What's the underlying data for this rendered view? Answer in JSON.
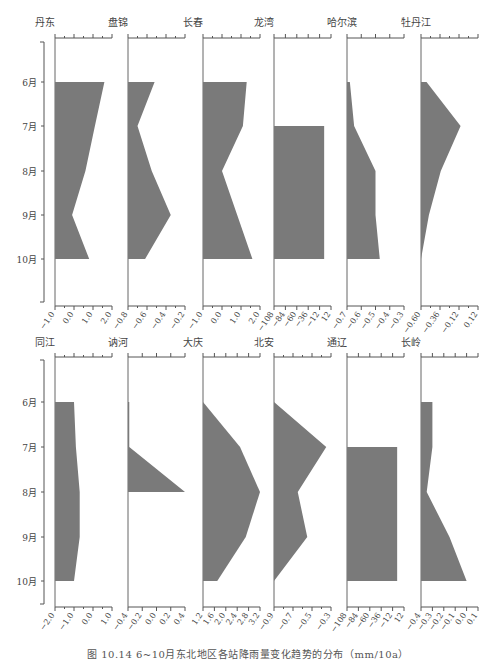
{
  "figure": {
    "caption": "图 10.14  6~10月东北地区各站降雨量变化趋势的分布（mm/10a）"
  },
  "chart_data": [
    {
      "type": "area",
      "orientation": "vertical-profile",
      "title": "丹东",
      "months": [
        "6月",
        "7月",
        "8月",
        "9月",
        "10月"
      ],
      "values": [
        1.6,
        1.1,
        0.6,
        -0.1,
        0.8
      ],
      "xlim": [
        -1.0,
        2.0
      ],
      "xticks": [
        "-1.0",
        "0.0",
        "1.0",
        "2.0"
      ],
      "baseline": -1.0,
      "row": "top"
    },
    {
      "type": "area",
      "orientation": "vertical-profile",
      "title": "盘锦",
      "months": [
        "6月",
        "7月",
        "8月",
        "9月",
        "10月"
      ],
      "values": [
        -0.52,
        -0.7,
        -0.55,
        -0.35,
        -0.62
      ],
      "xlim": [
        -0.8,
        -0.2
      ],
      "xticks": [
        "-0.8",
        "-0.6",
        "-0.4",
        "-0.2"
      ],
      "baseline": -0.8,
      "row": "top"
    },
    {
      "type": "area",
      "orientation": "vertical-profile",
      "title": "长春",
      "months": [
        "6月",
        "7月",
        "8月",
        "9月",
        "10月"
      ],
      "values": [
        1.3,
        1.1,
        0.0,
        0.8,
        1.6
      ],
      "xlim": [
        -1.0,
        2.0
      ],
      "xticks": [
        "-1.0",
        "0.0",
        "1.0",
        "2.0"
      ],
      "baseline": -1.0,
      "row": "top"
    },
    {
      "type": "area",
      "orientation": "vertical-profile",
      "title": "龙湾",
      "months": [
        "6月",
        "7月",
        "8月",
        "9月",
        "10月"
      ],
      "values": [
        null,
        0,
        0,
        0,
        0
      ],
      "xlim": [
        -108,
        12
      ],
      "xticks": [
        "-108",
        "-84",
        "-60",
        "-36",
        "-12",
        "12"
      ],
      "baseline": -108,
      "row": "top"
    },
    {
      "type": "area",
      "orientation": "vertical-profile",
      "title": "哈尔滨",
      "months": [
        "6月",
        "7月",
        "8月",
        "9月",
        "10月"
      ],
      "values": [
        -0.68,
        -0.65,
        -0.5,
        -0.5,
        -0.47
      ],
      "xlim": [
        -0.7,
        -0.3
      ],
      "xticks": [
        "-0.7",
        "-0.6",
        "-0.5",
        "-0.4",
        "-0.3"
      ],
      "baseline": -0.7,
      "row": "top"
    },
    {
      "type": "area",
      "orientation": "vertical-profile",
      "title": "牡丹江",
      "months": [
        "6月",
        "7月",
        "8月",
        "9月",
        "10月"
      ],
      "values": [
        -0.53,
        -0.1,
        -0.35,
        -0.5,
        -0.6
      ],
      "xlim": [
        -0.6,
        0.12
      ],
      "xticks": [
        "-0.60",
        "-0.36",
        "-0.12",
        "0.12"
      ],
      "baseline": -0.6,
      "row": "top"
    },
    {
      "type": "area",
      "orientation": "vertical-profile",
      "title": "同江",
      "months": [
        "6月",
        "7月",
        "8月",
        "9月",
        "10月"
      ],
      "values": [
        -1.0,
        -0.9,
        -0.7,
        -0.7,
        -1.0
      ],
      "xlim": [
        -2.0,
        1.0
      ],
      "xticks": [
        "-2.0",
        "-1.0",
        "0.0",
        "1.0"
      ],
      "baseline": -2.0,
      "row": "bottom"
    },
    {
      "type": "area",
      "orientation": "vertical-profile",
      "title": "讷河",
      "months": [
        "6月",
        "7月",
        "8月"
      ],
      "values": [
        -0.38,
        -0.38,
        0.5
      ],
      "xlim": [
        -0.4,
        0.5
      ],
      "xticks": [
        "-0.4",
        "-0.2",
        "0.0",
        "0.2",
        "0.4"
      ],
      "baseline": -0.4,
      "row": "bottom"
    },
    {
      "type": "area",
      "orientation": "vertical-profile",
      "title": "大庆",
      "months": [
        "6月",
        "7月",
        "8月",
        "9月",
        "10月"
      ],
      "values": [
        1.2,
        2.5,
        3.2,
        2.7,
        1.7
      ],
      "xlim": [
        1.2,
        3.2
      ],
      "xticks": [
        "1.2",
        "1.6",
        "2.0",
        "2.4",
        "2.8",
        "3.2"
      ],
      "baseline": 1.2,
      "row": "bottom"
    },
    {
      "type": "area",
      "orientation": "vertical-profile",
      "title": "北安",
      "months": [
        "6月",
        "7月",
        "8月",
        "9月",
        "10月"
      ],
      "values": [
        -0.9,
        -0.35,
        -0.65,
        -0.55,
        -0.9
      ],
      "xlim": [
        -0.9,
        -0.3
      ],
      "xticks": [
        "-0.9",
        "-0.7",
        "-0.5",
        "-0.3"
      ],
      "baseline": -0.9,
      "row": "bottom"
    },
    {
      "type": "area",
      "orientation": "vertical-profile",
      "title": "通辽",
      "months": [
        "6月",
        "7月",
        "8月",
        "9月",
        "10月"
      ],
      "values": [
        null,
        0,
        0,
        0,
        0
      ],
      "xlim": [
        -108,
        12
      ],
      "xticks": [
        "-108",
        "-84",
        "-60",
        "-36",
        "-12",
        "12"
      ],
      "baseline": -108,
      "row": "bottom"
    },
    {
      "type": "area",
      "orientation": "vertical-profile",
      "title": "长岭",
      "months": [
        "6月",
        "7月",
        "8月",
        "9月",
        "10月"
      ],
      "values": [
        -0.3,
        -0.3,
        -0.35,
        -0.15,
        0.0
      ],
      "xlim": [
        -0.4,
        0.1
      ],
      "xticks": [
        "-0.4",
        "-0.3",
        "-0.2",
        "-0.1",
        "0.0",
        "0.1"
      ],
      "baseline": -0.4,
      "row": "bottom"
    }
  ]
}
